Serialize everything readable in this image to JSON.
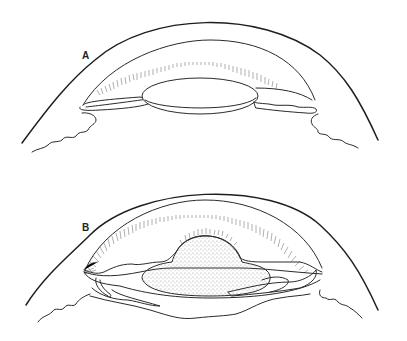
{
  "figure": {
    "panels": [
      {
        "id": "A",
        "label": "A"
      },
      {
        "id": "B",
        "label": "B"
      }
    ],
    "colors": {
      "line": "#2a2a2a",
      "hatch": "#7a7a7a",
      "background": "#ffffff"
    }
  }
}
